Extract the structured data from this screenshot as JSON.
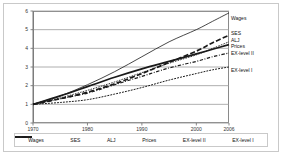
{
  "chart_data": {
    "type": "line",
    "title": "",
    "xlabel": "",
    "ylabel": "",
    "xlim": [
      1970,
      2006
    ],
    "ylim": [
      0,
      6
    ],
    "grid": true,
    "legend_position": "bottom",
    "x_ticks": [
      "1970",
      "1980",
      "1990",
      "2000",
      "2006"
    ],
    "y_ticks": [
      "0",
      "1",
      "2",
      "3",
      "4",
      "5",
      "6"
    ],
    "x": [
      1970,
      1975,
      1980,
      1985,
      1990,
      1995,
      2000,
      2003,
      2006
    ],
    "series": [
      {
        "name": "Wages",
        "style": "solid-thin",
        "end_label": "Wages",
        "values": [
          1.0,
          1.45,
          2.05,
          2.75,
          3.55,
          4.35,
          5.0,
          5.45,
          5.9
        ]
      },
      {
        "name": "SES",
        "style": "dashed-thick",
        "end_label": "SES",
        "values": [
          1.0,
          1.3,
          1.65,
          2.1,
          2.65,
          3.25,
          3.85,
          4.3,
          4.7
        ]
      },
      {
        "name": "ALJ",
        "style": "dotted",
        "end_label": "ALJ",
        "values": [
          1.0,
          1.35,
          1.75,
          2.2,
          2.7,
          3.2,
          3.65,
          4.0,
          4.35
        ]
      },
      {
        "name": "Prices",
        "style": "solid-thick",
        "end_label": "Prices",
        "values": [
          1.0,
          1.45,
          1.95,
          2.45,
          2.9,
          3.3,
          3.7,
          3.95,
          4.2
        ]
      },
      {
        "name": "EX-level II",
        "style": "dash-dot",
        "end_label": "EX-level II",
        "values": [
          1.0,
          1.3,
          1.6,
          2.05,
          2.5,
          2.95,
          3.3,
          3.55,
          3.75
        ]
      },
      {
        "name": "EX-level I",
        "style": "fine-dash",
        "end_label": "EX-level I",
        "values": [
          1.0,
          1.1,
          1.25,
          1.55,
          1.9,
          2.3,
          2.65,
          2.85,
          3.0
        ]
      }
    ]
  },
  "legend": {
    "items": [
      {
        "label": "Wages"
      },
      {
        "label": "SES"
      },
      {
        "label": "ALJ"
      },
      {
        "label": "Prices"
      },
      {
        "label": "EX-level II"
      },
      {
        "label": "EX-level I"
      }
    ]
  }
}
